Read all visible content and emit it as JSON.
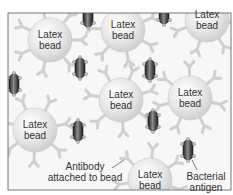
{
  "diagram": {
    "frame": {
      "x": 8,
      "y": 13,
      "width": 223,
      "height": 177,
      "border_color": "#555555"
    },
    "colors": {
      "bead_fill": "#e4e4e4",
      "bead_highlight": "#ffffff",
      "antibody": "#d2d2d2",
      "bacterium_dark": "#2a2a2a",
      "bacterium_mid": "#6e6e6e",
      "antigen": "#bcbcbc",
      "text": "#333333"
    },
    "beads": [
      {
        "label_line1": "Latex",
        "label_line2": "bead",
        "cx": 50,
        "cy": 40
      },
      {
        "label_line1": "Latex",
        "label_line2": "bead",
        "cx": 123,
        "cy": 30
      },
      {
        "label_line1": "Latex",
        "label_line2": "bead",
        "cx": 207,
        "cy": 20
      },
      {
        "label_line1": "Latex",
        "label_line2": "bead",
        "cx": 121,
        "cy": 100
      },
      {
        "label_line1": "Latex",
        "label_line2": "bead",
        "cx": 190,
        "cy": 98
      },
      {
        "label_line1": "Latex",
        "label_line2": "bead",
        "cx": 35,
        "cy": 130
      },
      {
        "label_line1": "Latex",
        "label_line2": "bead",
        "cx": 150,
        "cy": 180
      }
    ],
    "bacteria": [
      {
        "cx": 88,
        "cy": 17
      },
      {
        "cx": 164,
        "cy": 14
      },
      {
        "cx": 80,
        "cy": 68
      },
      {
        "cx": 14,
        "cy": 84
      },
      {
        "cx": 150,
        "cy": 70
      },
      {
        "cx": 78,
        "cy": 131
      },
      {
        "cx": 153,
        "cy": 121
      },
      {
        "cx": 188,
        "cy": 150
      }
    ],
    "callouts": {
      "antibody": {
        "line1": "Antibody",
        "line2": "attached to bead"
      },
      "antigen": {
        "line1": "Bacterial",
        "line2": "antigen"
      }
    }
  }
}
